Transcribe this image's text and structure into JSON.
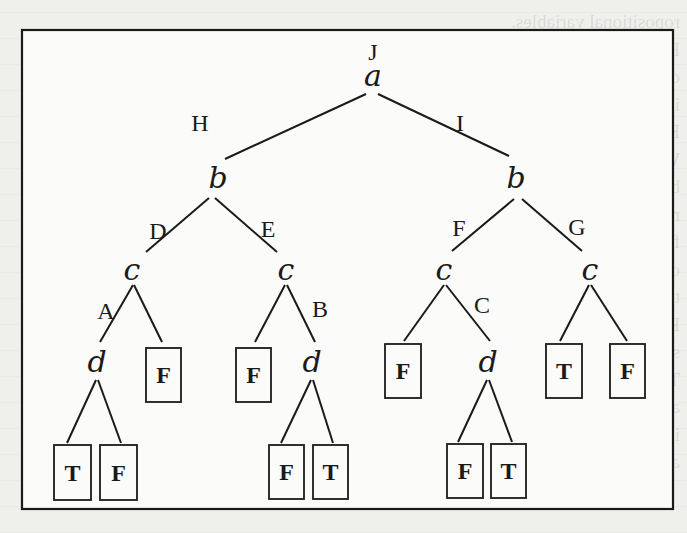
{
  "figure": {
    "type": "binary-decision-tree",
    "frame": {
      "x": 22,
      "y": 30,
      "width": 651,
      "height": 479
    },
    "colors": {
      "ink": "#1a1a1a",
      "paper": "#fbfbf9",
      "background": "#efefeb"
    },
    "root_label": {
      "text": "J",
      "x": 373,
      "y": 60
    }
  },
  "showthrough_lines": [
    "ropositional variables.",
    "By definition, a maximal consistent sub-environment",
    "of E is a subset E' = {A1,...,Ak} of E such that E'",
    "is consistent with W et there does not exist a subset",
    "E'' of E such that (E' ⊂ E'') and E'' is consistent with",
    "W. If we note by P the conjunction (A1∧···∧Ak), and",
    "by W the conjunction (W1∧···∧Wn) then E' is a maxi-",
    "mal consistent sub-environment of E if and only if the",
    "formula (P ∧ W) is satisfiable, which is the case if and",
    "only if its TDG is not the constant False. The problem",
    "thus comes down to finding all the maximal sub-products",
    "P' of the product (A1∧···∧Ak) such that (P'∧W) is",
    "satisfiable.",
    "These maximal sub-products can be computed using",
    "an algorithm that is very similar to the algorithm given",
    "in Section 4 for the minimal nonmonotonic problem. This",
    "algorithm works in two steps. The first step consists in"
  ],
  "nodes": [
    {
      "id": "a",
      "var": "a",
      "x": 373,
      "y": 86
    },
    {
      "id": "b1",
      "var": "b",
      "x": 218,
      "y": 188
    },
    {
      "id": "b2",
      "var": "b",
      "x": 516,
      "y": 188
    },
    {
      "id": "c1",
      "var": "c",
      "x": 132,
      "y": 280
    },
    {
      "id": "c2",
      "var": "c",
      "x": 286,
      "y": 280
    },
    {
      "id": "c3",
      "var": "c",
      "x": 444,
      "y": 280
    },
    {
      "id": "c4",
      "var": "c",
      "x": 590,
      "y": 280
    },
    {
      "id": "d1",
      "var": "d",
      "x": 97,
      "y": 372
    },
    {
      "id": "d2",
      "var": "d",
      "x": 312,
      "y": 372
    },
    {
      "id": "d3",
      "var": "d",
      "x": 488,
      "y": 372
    }
  ],
  "edges": [
    {
      "from": "a",
      "to": "b1",
      "x1": 366,
      "y1": 94,
      "x2": 225,
      "y2": 159,
      "label": "H",
      "lx": 200,
      "ly": 131
    },
    {
      "from": "a",
      "to": "b2",
      "x1": 378,
      "y1": 94,
      "x2": 509,
      "y2": 156,
      "label": "I",
      "lx": 460,
      "ly": 131
    },
    {
      "from": "b1",
      "to": "c1",
      "x1": 209,
      "y1": 198,
      "x2": 146,
      "y2": 252,
      "label": "D",
      "lx": 158,
      "ly": 239
    },
    {
      "from": "b1",
      "to": "c2",
      "x1": 215,
      "y1": 198,
      "x2": 277,
      "y2": 252,
      "label": "E",
      "lx": 268,
      "ly": 237
    },
    {
      "from": "b2",
      "to": "c3",
      "x1": 514,
      "y1": 199,
      "x2": 452,
      "y2": 251,
      "label": "F",
      "lx": 459,
      "ly": 236
    },
    {
      "from": "b2",
      "to": "c4",
      "x1": 522,
      "y1": 199,
      "x2": 582,
      "y2": 251,
      "label": "G",
      "lx": 577,
      "ly": 235
    },
    {
      "from": "c1",
      "to": "d1",
      "x1": 133,
      "y1": 285,
      "x2": 100,
      "y2": 342,
      "label": "A",
      "lx": 106,
      "ly": 319
    },
    {
      "from": "c1",
      "to": "L1",
      "x1": 134,
      "y1": 285,
      "x2": 162,
      "y2": 342,
      "label": "",
      "lx": 0,
      "ly": 0
    },
    {
      "from": "c2",
      "to": "L2",
      "x1": 285,
      "y1": 285,
      "x2": 255,
      "y2": 342,
      "label": "",
      "lx": 0,
      "ly": 0
    },
    {
      "from": "c2",
      "to": "d2",
      "x1": 287,
      "y1": 285,
      "x2": 315,
      "y2": 342,
      "label": "B",
      "lx": 320,
      "ly": 317
    },
    {
      "from": "c3",
      "to": "L3",
      "x1": 444,
      "y1": 285,
      "x2": 404,
      "y2": 341,
      "label": "",
      "lx": 0,
      "ly": 0
    },
    {
      "from": "c3",
      "to": "d3",
      "x1": 446,
      "y1": 285,
      "x2": 490,
      "y2": 341,
      "label": "C",
      "lx": 482,
      "ly": 313
    },
    {
      "from": "c4",
      "to": "L4",
      "x1": 589,
      "y1": 285,
      "x2": 560,
      "y2": 341,
      "label": "",
      "lx": 0,
      "ly": 0
    },
    {
      "from": "c4",
      "to": "L5",
      "x1": 591,
      "y1": 285,
      "x2": 627,
      "y2": 341,
      "label": "",
      "lx": 0,
      "ly": 0
    },
    {
      "from": "d1",
      "to": "L6",
      "x1": 96,
      "y1": 380,
      "x2": 67,
      "y2": 443,
      "label": "",
      "lx": 0,
      "ly": 0
    },
    {
      "from": "d1",
      "to": "L7",
      "x1": 98,
      "y1": 380,
      "x2": 121,
      "y2": 443,
      "label": "",
      "lx": 0,
      "ly": 0
    },
    {
      "from": "d2",
      "to": "L8",
      "x1": 311,
      "y1": 380,
      "x2": 281,
      "y2": 443,
      "label": "",
      "lx": 0,
      "ly": 0
    },
    {
      "from": "d2",
      "to": "L9",
      "x1": 313,
      "y1": 380,
      "x2": 333,
      "y2": 443,
      "label": "",
      "lx": 0,
      "ly": 0
    },
    {
      "from": "d3",
      "to": "L10",
      "x1": 487,
      "y1": 380,
      "x2": 458,
      "y2": 442,
      "label": "",
      "lx": 0,
      "ly": 0
    },
    {
      "from": "d3",
      "to": "L11",
      "x1": 489,
      "y1": 380,
      "x2": 512,
      "y2": 442,
      "label": "",
      "lx": 0,
      "ly": 0
    }
  ],
  "leaves": [
    {
      "id": "L1",
      "value": "F",
      "x": 146,
      "y": 348,
      "w": 35,
      "h": 54
    },
    {
      "id": "L2",
      "value": "F",
      "x": 236,
      "y": 348,
      "w": 35,
      "h": 54
    },
    {
      "id": "L3",
      "value": "F",
      "x": 385,
      "y": 344,
      "w": 36,
      "h": 54
    },
    {
      "id": "L4",
      "value": "T",
      "x": 546,
      "y": 344,
      "w": 36,
      "h": 54
    },
    {
      "id": "L5",
      "value": "F",
      "x": 610,
      "y": 344,
      "w": 35,
      "h": 54
    },
    {
      "id": "L6",
      "value": "T",
      "x": 54,
      "y": 445,
      "w": 37,
      "h": 55
    },
    {
      "id": "L7",
      "value": "F",
      "x": 100,
      "y": 445,
      "w": 37,
      "h": 55
    },
    {
      "id": "L8",
      "value": "F",
      "x": 269,
      "y": 445,
      "w": 35,
      "h": 54
    },
    {
      "id": "L9",
      "value": "T",
      "x": 313,
      "y": 445,
      "w": 35,
      "h": 54
    },
    {
      "id": "L10",
      "value": "F",
      "x": 447,
      "y": 444,
      "w": 36,
      "h": 54
    },
    {
      "id": "L11",
      "value": "T",
      "x": 491,
      "y": 444,
      "w": 35,
      "h": 54
    }
  ]
}
